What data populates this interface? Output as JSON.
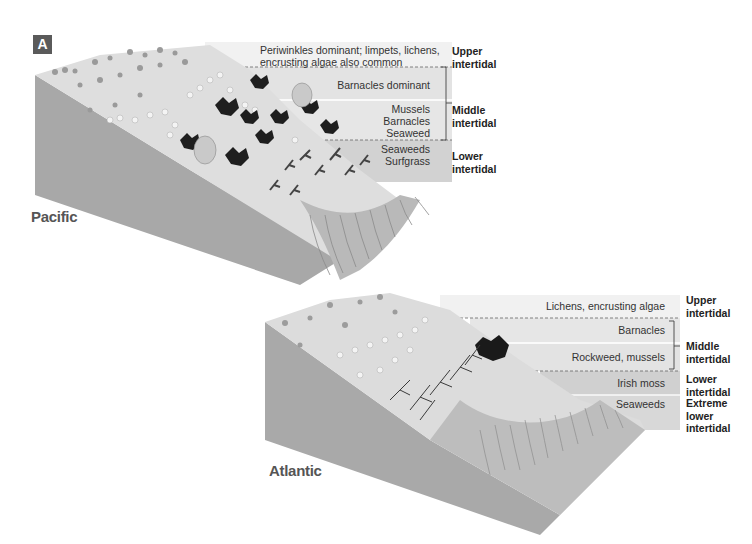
{
  "figure": {
    "panel_label": "A",
    "pacific": {
      "region_label": "Pacific",
      "bands": [
        {
          "text": "Periwinkles dominant; limpets, lichens, encrusting algae also common",
          "line1": "Periwinkles dominant; limpets, lichens,",
          "line2": "encrusting algae also common"
        },
        {
          "text": "Barnacles dominant"
        },
        {
          "text": "Mussels Barnacles Seaweed",
          "line1": "Mussels",
          "line2": "Barnacles",
          "line3": "Seaweed"
        },
        {
          "text": "Seaweeds Surfgrass",
          "line1": "Seaweeds",
          "line2": "Surfgrass"
        }
      ],
      "zones": [
        {
          "line1": "Upper",
          "line2": "intertidal"
        },
        {
          "line1": "Middle",
          "line2": "intertidal"
        },
        {
          "line1": "Lower",
          "line2": "intertidal"
        }
      ]
    },
    "atlantic": {
      "region_label": "Atlantic",
      "bands": [
        {
          "text": "Lichens, encrusting algae"
        },
        {
          "text": "Barnacles"
        },
        {
          "text": "Rockweed, mussels"
        },
        {
          "text": "Irish moss"
        },
        {
          "text": "Seaweeds"
        }
      ],
      "zones": [
        {
          "line1": "Upper",
          "line2": "intertidal"
        },
        {
          "line1": "Middle",
          "line2": "intertidal"
        },
        {
          "line1": "Lower",
          "line2": "intertidal"
        },
        {
          "line1": "Extreme",
          "line2": "lower",
          "line3": "intertidal"
        }
      ]
    },
    "colors": {
      "band_light": "#efefef",
      "band_mid": "#e2e2e2",
      "band_dark": "#cfcfcf",
      "block_side": "#a9a9a9",
      "surface": "#dcdcdc",
      "badge": "#5a5a5a"
    }
  }
}
